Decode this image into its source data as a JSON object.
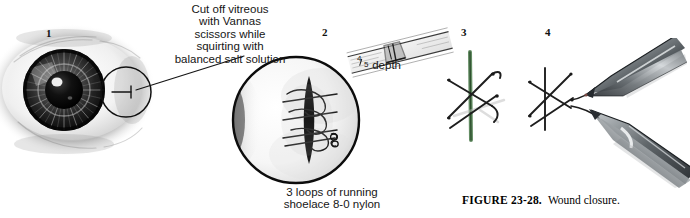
{
  "figure": {
    "caption_label": "FIGURE 23-28.",
    "caption_text": "Wound closure.",
    "background_color": "#ffffff",
    "ink_color": "#1a1a1a"
  },
  "panels": [
    {
      "number": "1",
      "name": "eye-overview",
      "description": "frontal view of eye with iris and pupil and magnification callout circle at limbus"
    },
    {
      "number": "2",
      "name": "wound-magnified",
      "description": "magnified circular view of wound with running shoelace suture loops"
    },
    {
      "number": "3",
      "name": "suture-crossing",
      "description": "crossed suture strands over green-tinted wound line"
    },
    {
      "number": "4",
      "name": "instrument-tying",
      "description": "two forceps grasping and tying the suture"
    }
  ],
  "annotations": {
    "callout": {
      "lines": [
        "Cut off vitreous",
        "with Vannas",
        "scissors while",
        "squirting with",
        "balanced salt solution"
      ]
    },
    "depth": {
      "numerator": "4",
      "denominator": "5",
      "label": "depth"
    },
    "loops": {
      "lines": [
        "3 loops of running",
        "shoelace 8-0 nylon"
      ]
    }
  },
  "colors": {
    "suture_green": "#4a7a4a",
    "instrument_gray": "#555a5e",
    "iris_dark": "#1b1b1b"
  }
}
